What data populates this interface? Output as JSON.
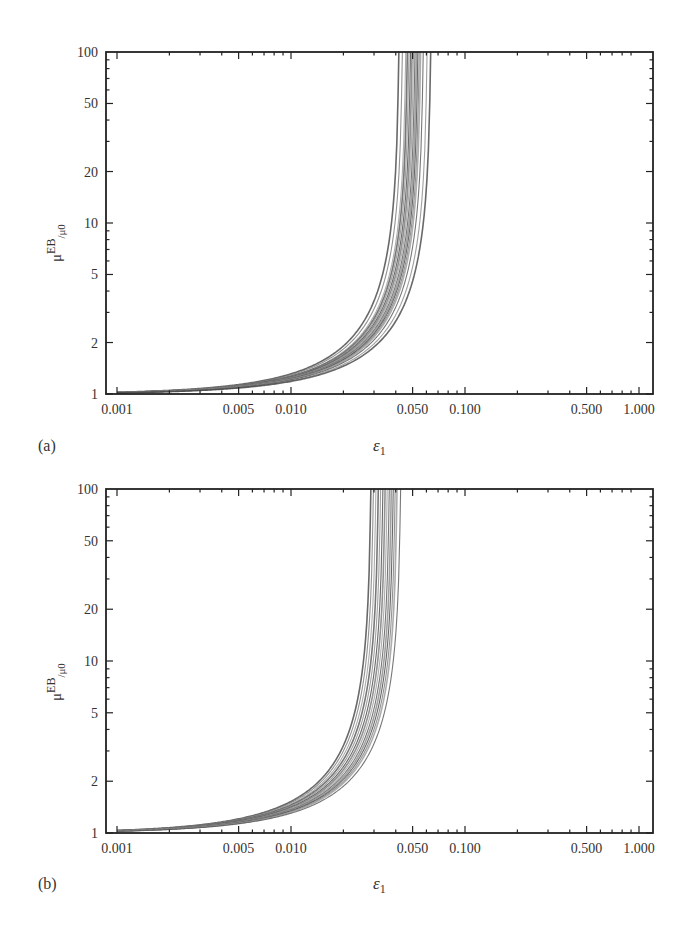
{
  "chart_data": [
    {
      "type": "line",
      "panel_label": "(a)",
      "title": "",
      "xlabel": "ε1",
      "ylabel": "μEB/μ0",
      "ylabel_parts": {
        "base": "μ",
        "sup": "EB",
        "sub": "/μ0"
      },
      "xscale": "log",
      "yscale": "log",
      "xlim": [
        0.001,
        1.0
      ],
      "ylim": [
        1,
        100
      ],
      "xticks": [
        "0.001",
        "0.005",
        "0.010",
        "0.050",
        "0.100",
        "0.500",
        "1.000"
      ],
      "xtick_values": [
        0.001,
        0.005,
        0.01,
        0.05,
        0.1,
        0.5,
        1.0
      ],
      "yticks": [
        "1",
        "2",
        "5",
        "10",
        "20",
        "50",
        "100"
      ],
      "ytick_values": [
        1,
        2,
        5,
        10,
        20,
        50,
        100
      ],
      "grid": false,
      "legend": null,
      "description": "Family of many overlapping curves, each rising from ~1 at ε1=0.001 and diverging to 100 near ε1≈0.042–0.065",
      "model": "mu = 1 / (1 - eps/eps_c)",
      "series_critical_eps": [
        0.042,
        0.044,
        0.046,
        0.047,
        0.048,
        0.049,
        0.05,
        0.051,
        0.052,
        0.053,
        0.054,
        0.055,
        0.056,
        0.058,
        0.061,
        0.064
      ],
      "sample_points": {
        "x": [
          0.001,
          0.005,
          0.01,
          0.02,
          0.03,
          0.04,
          0.045,
          0.05
        ],
        "y_center": [
          1.02,
          1.11,
          1.25,
          1.65,
          2.5,
          5.0,
          10.0,
          50.0
        ]
      }
    },
    {
      "type": "line",
      "panel_label": "(b)",
      "title": "",
      "xlabel": "ε1",
      "ylabel": "μEB/μ0",
      "ylabel_parts": {
        "base": "μ",
        "sup": "EB",
        "sub": "/μ0"
      },
      "xscale": "log",
      "yscale": "log",
      "xlim": [
        0.001,
        1.0
      ],
      "ylim": [
        1,
        100
      ],
      "xticks": [
        "0.001",
        "0.005",
        "0.010",
        "0.050",
        "0.100",
        "0.500",
        "1.000"
      ],
      "xtick_values": [
        0.001,
        0.005,
        0.01,
        0.05,
        0.1,
        0.5,
        1.0
      ],
      "yticks": [
        "1",
        "2",
        "5",
        "10",
        "20",
        "50",
        "100"
      ],
      "ytick_values": [
        1,
        2,
        5,
        10,
        20,
        50,
        100
      ],
      "grid": false,
      "legend": null,
      "description": "Family of many overlapping curves, each rising from ~1 at ε1=0.001 and diverging to 100 near ε1≈0.029–0.043",
      "model": "mu = 1 / (1 - eps/eps_c)",
      "series_critical_eps": [
        0.029,
        0.03,
        0.031,
        0.032,
        0.033,
        0.034,
        0.035,
        0.036,
        0.037,
        0.038,
        0.039,
        0.04,
        0.041,
        0.043
      ],
      "sample_points": {
        "x": [
          0.001,
          0.005,
          0.01,
          0.015,
          0.02,
          0.025,
          0.03,
          0.034
        ],
        "y_center": [
          1.03,
          1.17,
          1.4,
          1.8,
          2.4,
          3.7,
          8.0,
          50.0
        ]
      }
    }
  ],
  "panels": {
    "a": {
      "label": "(a)",
      "xlabel": "ε",
      "xlabel_sub": "1"
    },
    "b": {
      "label": "(b)",
      "xlabel": "ε",
      "xlabel_sub": "1"
    }
  },
  "style": {
    "curve_color": "#555555",
    "axis_color": "#222222",
    "background": "#ffffff"
  }
}
